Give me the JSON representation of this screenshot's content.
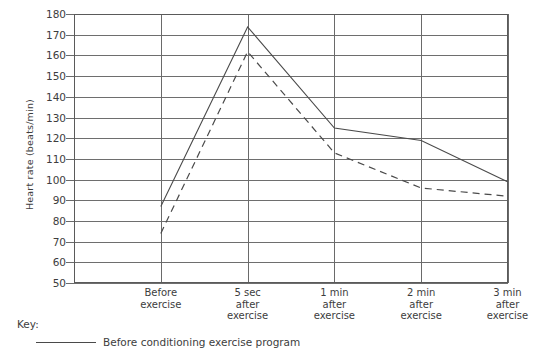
{
  "chart_data": {
    "type": "line",
    "title": "",
    "xlabel": "",
    "ylabel": "Heart rate (beats/min)",
    "ylim": [
      50,
      180
    ],
    "ystep": 10,
    "yticks": [
      180,
      170,
      160,
      150,
      140,
      130,
      120,
      110,
      100,
      90,
      80,
      70,
      60,
      50
    ],
    "grid": true,
    "categories": [
      "Before\nexercise",
      "5 sec\nafter\nexercise",
      "1 min\nafter\nexercise",
      "2 min\nafter\nexercise",
      "3 min\nafter\nexercise"
    ],
    "categories_flat": [
      "Before exercise",
      "5 sec after exercise",
      "1 min after exercise",
      "2 min after exercise",
      "3 min after exercise"
    ],
    "series": [
      {
        "name": "Before conditioning exercise program",
        "style": "solid",
        "color": "#4a4a4a",
        "values": [
          87,
          174,
          125,
          119,
          99
        ]
      },
      {
        "name": "",
        "style": "dashed",
        "color": "#4a4a4a",
        "values": [
          74,
          162,
          113,
          96,
          92
        ]
      }
    ],
    "legend_position": "bottom-left"
  },
  "axis": {
    "y_title": "Heart rate (beats/min)",
    "y_tick_labels": [
      "180",
      "170",
      "160",
      "150",
      "140",
      "130",
      "120",
      "110",
      "100",
      "90",
      "80",
      "70",
      "60",
      "50"
    ],
    "x_tick_labels": [
      [
        "Before",
        "exercise"
      ],
      [
        "5 sec",
        "after",
        "exercise"
      ],
      [
        "1 min",
        "after",
        "exercise"
      ],
      [
        "2 min",
        "after",
        "exercise"
      ],
      [
        "3 min",
        "after",
        "exercise"
      ]
    ]
  },
  "legend": {
    "key_label": "Key:",
    "entries": [
      {
        "label": "Before conditioning exercise program",
        "style": "solid"
      }
    ]
  },
  "colors": {
    "line": "#4a4a4a",
    "grid": "#6e6e6e",
    "frame": "#5a5a5a",
    "text": "#3d3d3d",
    "background": "#ffffff"
  }
}
